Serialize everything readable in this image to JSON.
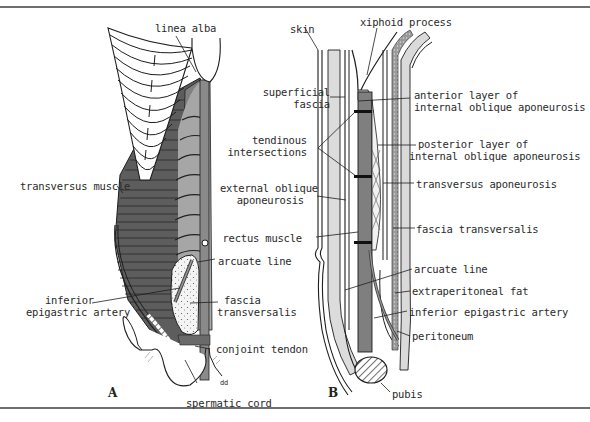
{
  "figure": {
    "panels": [
      {
        "id": "A",
        "letter": "A"
      },
      {
        "id": "B",
        "letter": "B"
      }
    ],
    "colors": {
      "ink": "#1e1e1e",
      "rule": "#6e6e6e",
      "muscle_dark": "#5a5a5a",
      "muscle_mid": "#7c7c7c",
      "rectus_gray": "#a8a8a8",
      "light_gray": "#d8d8d8",
      "background": "#ffffff"
    }
  },
  "panel_a": {
    "labels": {
      "linea_alba": "linea alba",
      "transversus_muscle": "transversus muscle",
      "arcuate_line": "arcuate line",
      "inferior_epigastric_artery_1": "inferior",
      "inferior_epigastric_artery_2": "epigastric artery",
      "fascia_transversalis_1": "fascia",
      "fascia_transversalis_2": "transversalis",
      "conjoint_tendon": "conjoint tendon",
      "spermatic_cord": "spermatic cord",
      "dd": "dd"
    }
  },
  "panel_b": {
    "labels": {
      "skin": "skin",
      "xiphoid_process": "xiphoid process",
      "superficial_fascia_1": "superficial",
      "superficial_fascia_2": "fascia",
      "anterior_layer_1": "anterior layer of",
      "anterior_layer_2": "internal oblique aponeurosis",
      "tendinous_intersections_1": "tendinous",
      "tendinous_intersections_2": "intersections",
      "posterior_layer_1": "posterior layer of",
      "posterior_layer_2": "internal oblique aponeurosis",
      "external_oblique_1": "external oblique",
      "external_oblique_2": "aponeurosis",
      "transversus_aponeurosis": "transversus aponeurosis",
      "rectus_muscle": "rectus muscle",
      "fascia_transversalis": "fascia transversalis",
      "arcuate_line": "arcuate line",
      "extraperitoneal_fat": "extraperitoneal fat",
      "inferior_epigastric_artery": "inferior epigastric artery",
      "peritoneum": "peritoneum",
      "pubis": "pubis"
    }
  }
}
